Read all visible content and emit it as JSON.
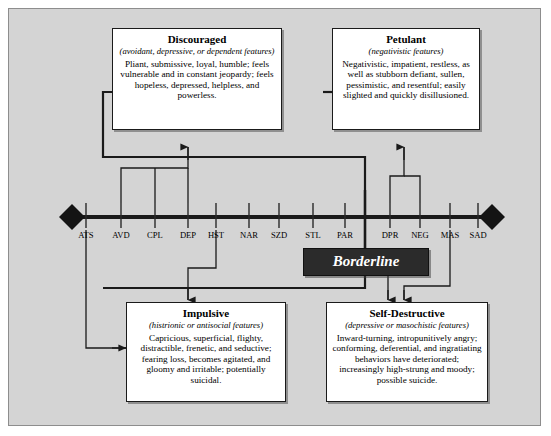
{
  "diagram": {
    "title": "Borderline",
    "center_label": "Borderline",
    "spectrum": {
      "ticks": [
        {
          "code": "ATS",
          "x": 86
        },
        {
          "code": "AVD",
          "x": 121
        },
        {
          "code": "CPL",
          "x": 155
        },
        {
          "code": "DEP",
          "x": 188
        },
        {
          "code": "HST",
          "x": 216
        },
        {
          "code": "NAR",
          "x": 249
        },
        {
          "code": "SZD",
          "x": 279
        },
        {
          "code": "STL",
          "x": 313
        },
        {
          "code": "PAR",
          "x": 345
        },
        {
          "code": "DPR",
          "x": 390
        },
        {
          "code": "NEG",
          "x": 420
        },
        {
          "code": "MAS",
          "x": 450
        },
        {
          "code": "SAD",
          "x": 478
        }
      ]
    },
    "boxes": [
      {
        "id": "discouraged",
        "title": "Discouraged",
        "subtitle": "(avoidant, depressive, or dependent features)",
        "body": "Pliant, submissive, loyal, humble; feels vulnerable and in constant jeopardy; feels hopeless, depressed, helpless, and powerless."
      },
      {
        "id": "petulant",
        "title": "Petulant",
        "subtitle": "(negativistic features)",
        "body": "Negativistic, impatient, restless, as well as stubborn defiant, sullen, pessimistic, and resentful; easily slighted and quickly disillusioned."
      },
      {
        "id": "impulsive",
        "title": "Impulsive",
        "subtitle": "(histrionic or antisocial features)",
        "body": "Capricious, superficial, flighty, distractible, frenetic, and seductive; fearing loss, becomes agitated, and gloomy and irritable; potentially suicidal."
      },
      {
        "id": "self_destructive",
        "title": "Self-Destructive",
        "subtitle": "(depressive or masochistic features)",
        "body": "Inward-turning, intropunitively angry; conforming, deferential, and ingratiating behaviors have deteriorated; increasingly high-strung and moody; possible suicide."
      }
    ],
    "colors": {
      "background": "#d4d4d4",
      "frame_border": "#8d8d8d",
      "line": "#1a1a1a",
      "banner_fill": "#2b2b2b",
      "banner_text": "#ffffff",
      "box_fill": "#ffffff"
    }
  }
}
